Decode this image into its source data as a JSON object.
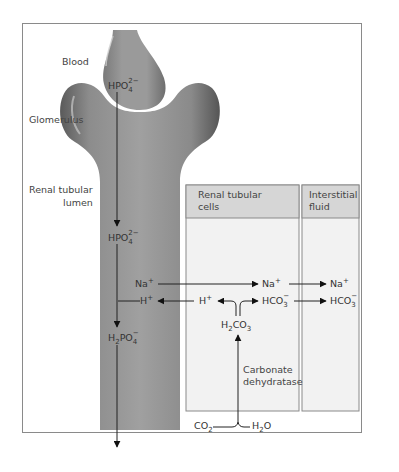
{
  "diagram": {
    "regions": {
      "blood": "Blood",
      "glomerulus": "Glomerulus",
      "lumen_line1": "Renal tubular",
      "lumen_line2": "lumen"
    },
    "panels": [
      {
        "line1": "Renal tubular",
        "line2": "cells"
      },
      {
        "line1": "Interstitial",
        "line2": "fluid"
      }
    ],
    "species": {
      "hpo4_blood": {
        "base": "HPO",
        "sub": "4",
        "sup": "2−"
      },
      "hpo4_lumen": {
        "base": "HPO",
        "sub": "4",
        "sup": "2−"
      },
      "h2po4": {
        "pre": "H",
        "sub1": "2",
        "base": "PO",
        "sub": "4",
        "sup": "−"
      },
      "na_lumen": {
        "base": "Na",
        "sup": "+"
      },
      "na_cell": {
        "base": "Na",
        "sup": "+"
      },
      "na_isf": {
        "base": "Na",
        "sup": "+"
      },
      "h_lumen": {
        "base": "H",
        "sup": "+"
      },
      "h_cell": {
        "base": "H",
        "sup": "+"
      },
      "hco3_cell": {
        "base": "HCO",
        "sub": "3",
        "sup": "−"
      },
      "hco3_isf": {
        "base": "HCO",
        "sub": "3",
        "sup": "−"
      },
      "h2co3": {
        "pre": "H",
        "sub1": "2",
        "base": "CO",
        "sub": "3"
      },
      "co2": {
        "base": "CO",
        "sub": "2"
      },
      "h2o": {
        "pre": "H",
        "sub1": "2",
        "base": "O"
      }
    },
    "enzyme": {
      "line1": "Carbonate",
      "line2": "dehydratase"
    },
    "colors": {
      "tube": "#8e8e8e",
      "tube_dark": "#5e5e5e",
      "panel_header": "#d6d6d6",
      "panel_body": "#f2f2f2",
      "frame": "#8a8a8a",
      "arrow": "#111111"
    }
  }
}
